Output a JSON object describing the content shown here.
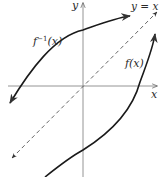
{
  "diagram": {
    "axes": {
      "x_label": "x",
      "y_label": "y"
    },
    "reference_line": {
      "label": "y = x",
      "style": "dashed",
      "color": "#555555"
    },
    "curves": [
      {
        "name": "f-inverse",
        "label_base": "f",
        "label_sup": "−1",
        "label_arg": "(x)",
        "color": "#1a1a1a"
      },
      {
        "name": "f",
        "label": "f(x)",
        "color": "#1a1a1a"
      }
    ],
    "colors": {
      "axis": "#777777",
      "curve": "#1a1a1a",
      "dashed": "#555555",
      "background": "#ffffff"
    }
  }
}
